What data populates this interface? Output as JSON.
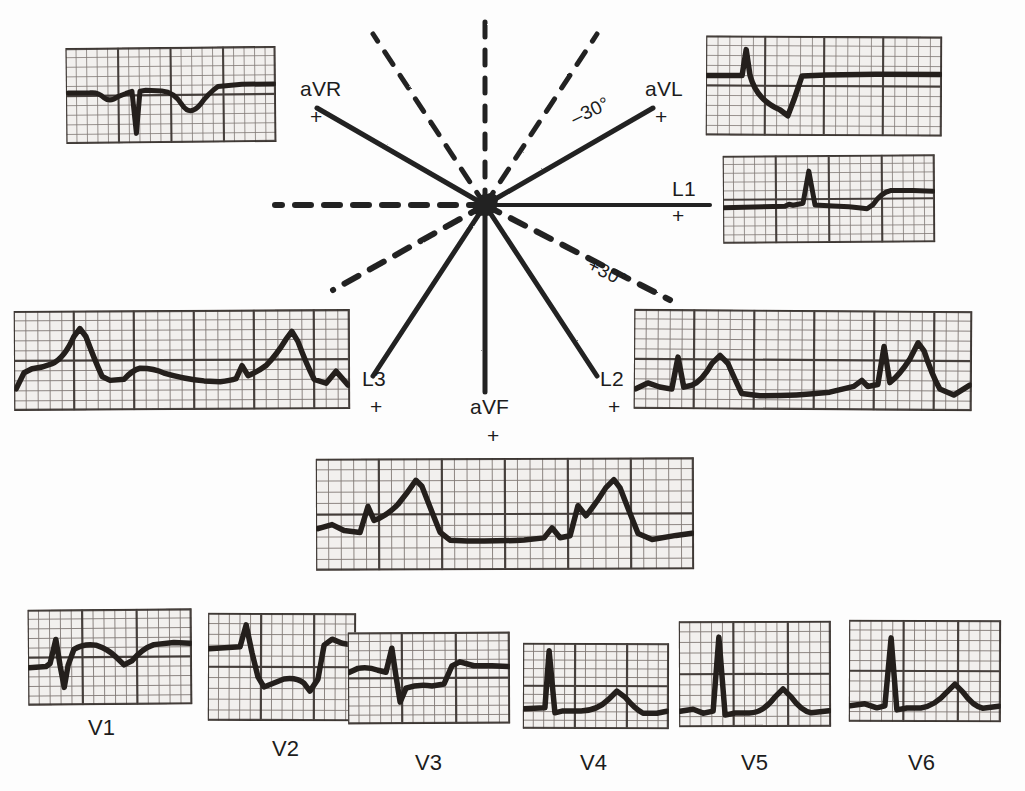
{
  "figure": {
    "kind": "hexaxial-reference-with-12-lead-ecg",
    "background_color": "#fdfdfd",
    "ink_color": "#1c1c1c",
    "paper_color": "#f2f0ee"
  },
  "axis_diagram": {
    "center_label": "",
    "angle_labels": [
      {
        "id": "minus30",
        "text": "–30°"
      },
      {
        "id": "plus30",
        "text": "+30°"
      }
    ],
    "axes": [
      {
        "id": "aVR",
        "label": "aVR",
        "polarity": "+",
        "angle_deg": -150,
        "style": "solid"
      },
      {
        "id": "aVL",
        "label": "aVL",
        "polarity": "+",
        "angle_deg": -30,
        "style": "solid"
      },
      {
        "id": "L1",
        "label": "L1",
        "polarity": "+",
        "angle_deg": 0,
        "style": "solid"
      },
      {
        "id": "L2",
        "label": "L2",
        "polarity": "+",
        "angle_deg": 60,
        "style": "solid"
      },
      {
        "id": "L3",
        "label": "L3",
        "polarity": "+",
        "angle_deg": 120,
        "style": "solid"
      },
      {
        "id": "aVF",
        "label": "aVF",
        "polarity": "+",
        "angle_deg": 90,
        "style": "solid"
      }
    ],
    "dashed_axes": [
      {
        "id": "neg-L1",
        "angle_deg": 180
      },
      {
        "id": "neg-L2",
        "angle_deg": -120
      },
      {
        "id": "neg-L3",
        "angle_deg": -60
      },
      {
        "id": "neg-aVF",
        "angle_deg": -90
      },
      {
        "id": "neg-aVR",
        "angle_deg": 30
      },
      {
        "id": "neg-aVL",
        "angle_deg": 150
      }
    ]
  },
  "limb_leads": [
    {
      "id": "aVR",
      "label": "aVR",
      "polarity": "+"
    },
    {
      "id": "aVL",
      "label": "aVL",
      "polarity": "+"
    },
    {
      "id": "L1",
      "label": "L1",
      "polarity": "+"
    },
    {
      "id": "L2",
      "label": "L2",
      "polarity": "+"
    },
    {
      "id": "L3",
      "label": "L3",
      "polarity": "+"
    },
    {
      "id": "aVF",
      "label": "aVF",
      "polarity": "+"
    }
  ],
  "precordial_leads": [
    {
      "id": "V1",
      "label": "V1"
    },
    {
      "id": "V2",
      "label": "V2"
    },
    {
      "id": "V3",
      "label": "V3"
    },
    {
      "id": "V4",
      "label": "V4"
    },
    {
      "id": "V5",
      "label": "V5"
    },
    {
      "id": "V6",
      "label": "V6"
    }
  ],
  "strips": {
    "aVR": {
      "lead": "aVR",
      "morphology": "negative QRS, inverted T",
      "beats": 1
    },
    "aVL": {
      "lead": "aVL",
      "morphology": "deep QS deflection",
      "beats": 1
    },
    "L1": {
      "lead": "L1",
      "morphology": "small R wave, low amplitude",
      "beats": 1
    },
    "L3": {
      "lead": "L3",
      "morphology": "tall peaked R waves",
      "beats": 3
    },
    "L2": {
      "lead": "L2",
      "morphology": "tall R waves with broad T",
      "beats": 3
    },
    "aVF": {
      "lead": "aVF",
      "morphology": "tall R waves, broad peaks",
      "beats": 3
    },
    "V1": {
      "lead": "V1",
      "morphology": "rS pattern, small r",
      "beats": 1
    },
    "V2": {
      "lead": "V2",
      "morphology": "deep S wave",
      "beats": 1
    },
    "V3": {
      "lead": "V3",
      "morphology": "biphasic RS",
      "beats": 1
    },
    "V4": {
      "lead": "V4",
      "morphology": "tall R with upright T",
      "beats": 1
    },
    "V5": {
      "lead": "V5",
      "morphology": "tall narrow R, broad T",
      "beats": 1
    },
    "V6": {
      "lead": "V6",
      "morphology": "tall R with rounded T",
      "beats": 1
    }
  }
}
